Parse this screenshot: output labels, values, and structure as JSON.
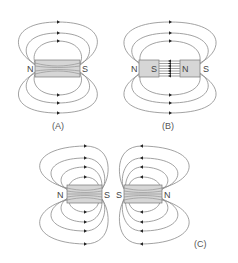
{
  "figure": {
    "panels": [
      {
        "id": "A",
        "caption": "(A)",
        "description": "Single bar magnet with field lines looping from N to S",
        "magnets": [
          {
            "left_pole": "N",
            "right_pole": "S"
          }
        ]
      },
      {
        "id": "B",
        "caption": "(B)",
        "description": "Two bar magnets with opposite poles facing (attraction); field lines pass straight between S and N",
        "magnets": [
          {
            "left_pole": "N",
            "right_pole": "S"
          },
          {
            "left_pole": "N",
            "right_pole": "S"
          }
        ]
      },
      {
        "id": "C",
        "caption": "(C)",
        "description": "Two bar magnets with like poles facing (S-S repulsion); field lines diverge away from gap",
        "magnets": [
          {
            "left_pole": "N",
            "right_pole": "S"
          },
          {
            "left_pole": "S",
            "right_pole": "N"
          }
        ]
      }
    ]
  },
  "colors": {
    "field_line": "#8a8a8a",
    "magnet_fill": "#d6d6d6",
    "arrow": "#222222",
    "text": "#444444"
  }
}
